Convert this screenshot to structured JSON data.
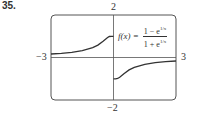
{
  "problem_number": "35.",
  "chart_data": {
    "type": "line",
    "title": "",
    "function_label": "f(x) = (1 − e^{1/x}) / (1 + e^{1/x})",
    "formula": {
      "lhs": "f(x) =",
      "numerator": "1 − e",
      "denominator": "1 + e",
      "exponent": "1/x"
    },
    "xlabel": "",
    "ylabel": "",
    "xlim": [
      -3,
      3
    ],
    "ylim": [
      -2,
      2
    ],
    "tick_labels": {
      "x_min": "−3",
      "x_max": "3",
      "y_max": "2",
      "y_min": "−2"
    },
    "grid": false,
    "legend": "none",
    "series": [
      {
        "name": "left branch (x<0)",
        "x": [
          -3,
          -2.5,
          -2,
          -1.5,
          -1,
          -0.75,
          -0.5,
          -0.3,
          -0.2,
          -0.1,
          -0.05,
          0
        ],
        "values": [
          0.165,
          0.197,
          0.245,
          0.32,
          0.462,
          0.583,
          0.762,
          0.934,
          0.987,
          1.0,
          1.0,
          1.0
        ]
      },
      {
        "name": "right branch (x>0)",
        "x": [
          0,
          0.05,
          0.1,
          0.2,
          0.3,
          0.5,
          0.75,
          1,
          1.5,
          2,
          2.5,
          3
        ],
        "values": [
          -1.0,
          -1.0,
          -1.0,
          -0.987,
          -0.934,
          -0.762,
          -0.583,
          -0.462,
          -0.32,
          -0.245,
          -0.197,
          -0.165
        ]
      }
    ],
    "colors": {
      "curve": "#333333",
      "axes": "#555555",
      "frame": "#555555"
    }
  }
}
